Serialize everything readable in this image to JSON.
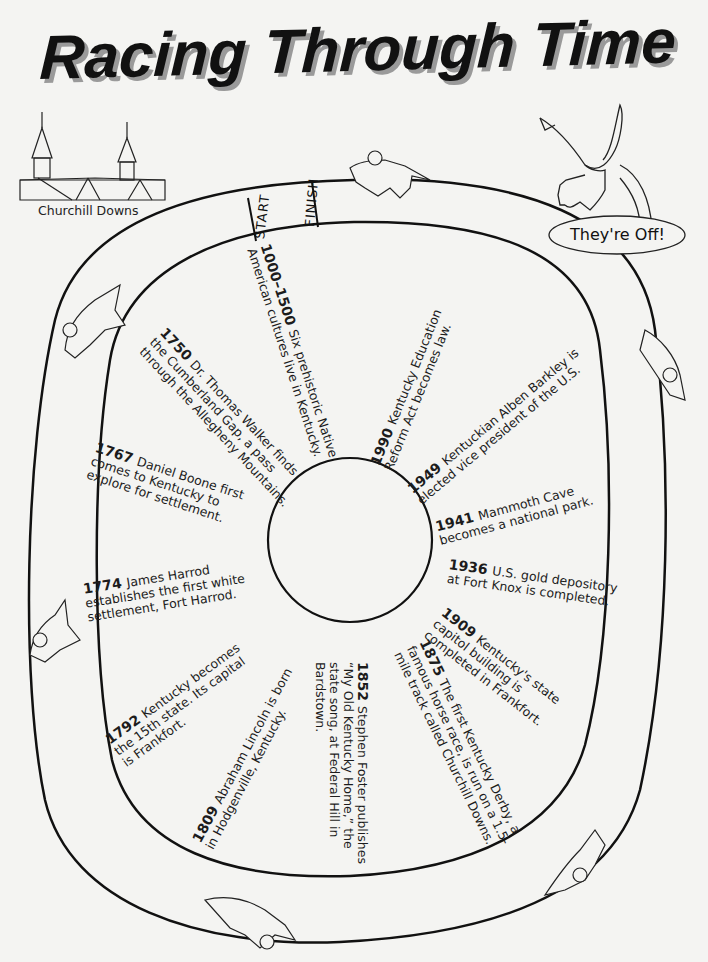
{
  "title": "Racing Through Time",
  "landmark": {
    "caption": "Churchill Downs",
    "icon": "churchill-downs-twin-spires-drawing"
  },
  "track": {
    "start_label": "START",
    "finish_label": "FINISH",
    "horses": [
      "horse-jockey-top",
      "horse-jockey-left-upper",
      "horse-jockey-left-lower",
      "horse-jockey-bottom",
      "horse-jockey-right-lower",
      "horse-jockey-right-upper"
    ]
  },
  "mascot": {
    "icon": "winged-horse-drawing",
    "speech": "They're Off!"
  },
  "events": [
    {
      "year": "1000–1500",
      "lines": [
        "Six prehistoric Native",
        "American cultures live in Kentucky."
      ]
    },
    {
      "year": "1750",
      "lines": [
        "Dr. Thomas Walker finds",
        "the Cumberland Gap, a pass",
        "through the Allegheny Mountains."
      ]
    },
    {
      "year": "1767",
      "lines": [
        "Daniel Boone first",
        "comes to Kentucky to",
        "explore for settlement."
      ]
    },
    {
      "year": "1774",
      "lines": [
        "James Harrod",
        "establishes the first white",
        "settlement, Fort Harrod."
      ]
    },
    {
      "year": "1792",
      "lines": [
        "Kentucky becomes",
        "the 15th state. Its capital",
        "is Frankfort."
      ]
    },
    {
      "year": "1809",
      "lines": [
        "Abraham Lincoln is born",
        "in Hodgenville, Kentucky."
      ]
    },
    {
      "year": "1852",
      "lines": [
        "Stephen Foster publishes",
        "“My Old Kentucky Home,” the",
        "state song, at Federal Hill in",
        "Bardstown."
      ]
    },
    {
      "year": "1875",
      "lines": [
        "The first Kentucky Derby, a",
        "famous horse race, is run on a 1.5-",
        "mile track called Churchill Downs."
      ]
    },
    {
      "year": "1909",
      "lines": [
        "Kentucky's state",
        "capitol building is",
        "completed in Frankfort."
      ]
    },
    {
      "year": "1936",
      "lines": [
        "U.S. gold depository",
        "at Fort Knox is completed."
      ]
    },
    {
      "year": "1941",
      "lines": [
        "Mammoth Cave",
        "becomes a national park."
      ]
    },
    {
      "year": "1949",
      "lines": [
        "Kentuckian Alben Barkley is",
        "elected vice president of the U.S."
      ]
    },
    {
      "year": "1990",
      "lines": [
        "Kentucky Education",
        "Reform Act becomes law."
      ]
    }
  ]
}
